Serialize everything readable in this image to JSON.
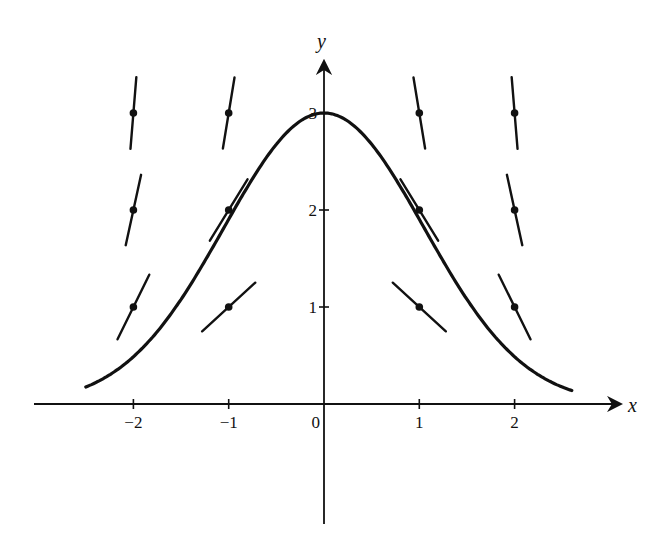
{
  "diagram": {
    "type": "slope-field-with-solution-curve",
    "axes": {
      "x_label": "x",
      "y_label": "y",
      "x_ticks": [
        {
          "value": -2,
          "label": "−2"
        },
        {
          "value": -1,
          "label": "−1"
        },
        {
          "value": 0,
          "label": "0"
        },
        {
          "value": 1,
          "label": "1"
        },
        {
          "value": 2,
          "label": "2"
        }
      ],
      "y_ticks": [
        {
          "value": 1,
          "label": "1"
        },
        {
          "value": 2,
          "label": "2"
        },
        {
          "value": 3,
          "label": "3"
        }
      ],
      "x_range": [
        -3.05,
        3.1
      ],
      "y_range": [
        -1.25,
        3.8
      ]
    },
    "slope_segments": [
      {
        "x": -2,
        "y": 3,
        "slope": 12
      },
      {
        "x": -2,
        "y": 2,
        "slope": 4.5
      },
      {
        "x": -2,
        "y": 1,
        "slope": 2
      },
      {
        "x": -1,
        "y": 3,
        "slope": 6
      },
      {
        "x": -1,
        "y": 2,
        "slope": 1.6
      },
      {
        "x": -1,
        "y": 1,
        "slope": 0.9
      },
      {
        "x": 1,
        "y": 3,
        "slope": -6
      },
      {
        "x": 1,
        "y": 2,
        "slope": -1.6
      },
      {
        "x": 1,
        "y": 1,
        "slope": -0.9
      },
      {
        "x": 2,
        "y": 3,
        "slope": -12
      },
      {
        "x": 2,
        "y": 2,
        "slope": -4.5
      },
      {
        "x": 2,
        "y": 1,
        "slope": -2
      }
    ],
    "solution_curve": {
      "description": "Bell-shaped solution curve with maximum at (0, 3)",
      "peak": {
        "x": 0,
        "y": 3
      },
      "x_start": -2.5,
      "x_end": 2.6
    }
  }
}
